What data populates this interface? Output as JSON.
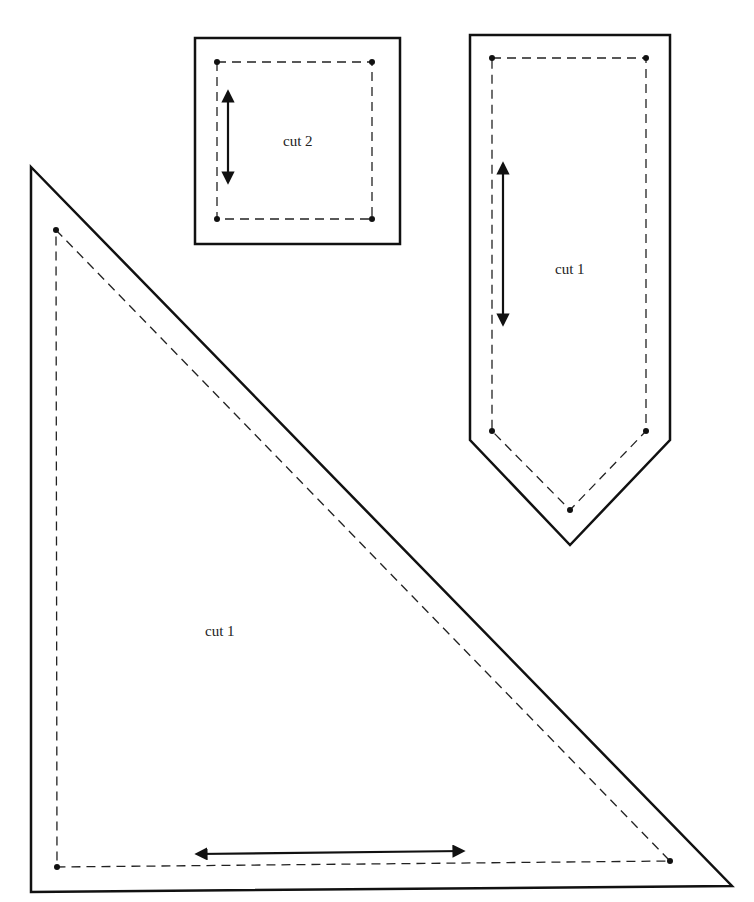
{
  "diagram": {
    "type": "sewing-pattern-pieces",
    "pieces": [
      {
        "id": "square",
        "label": "cut 2",
        "shape": "square",
        "grainline": "vertical"
      },
      {
        "id": "pennant",
        "label": "cut 1",
        "shape": "pointed-rectangle",
        "grainline": "vertical"
      },
      {
        "id": "triangle",
        "label": "cut 1",
        "shape": "right-triangle",
        "grainline": "horizontal"
      }
    ],
    "colors": {
      "line": "#111111",
      "background": "#ffffff"
    }
  }
}
